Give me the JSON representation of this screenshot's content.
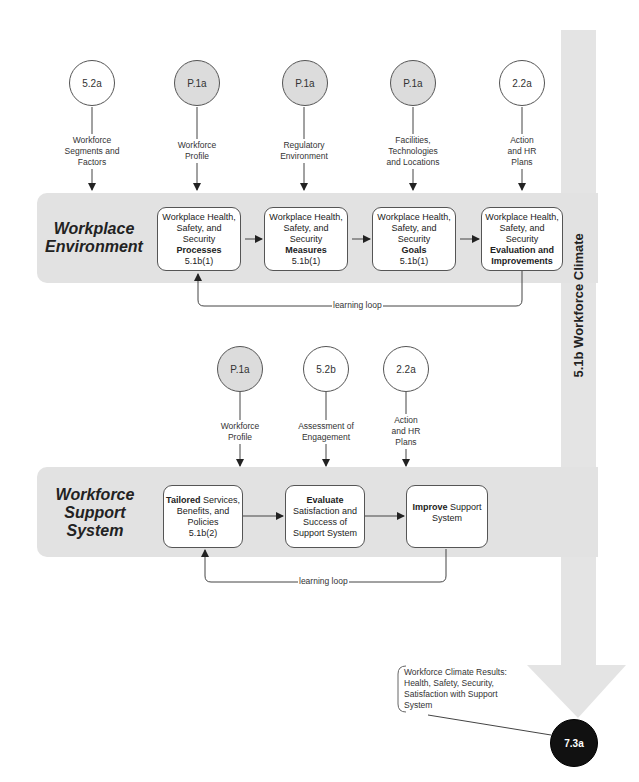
{
  "diagram": {
    "vertical_title": "5.1b  Workforce Climate",
    "workplace_environment": {
      "title_line1": "Workplace",
      "title_line2": "Environment",
      "inputs": [
        {
          "ref": "5.2a",
          "shaded": false,
          "label": [
            "Workforce",
            "Segments and",
            "Factors"
          ]
        },
        {
          "ref": "P.1a",
          "shaded": true,
          "label": [
            "Workforce",
            "Profile"
          ]
        },
        {
          "ref": "P.1a",
          "shaded": true,
          "label": [
            "Regulatory",
            "Environment"
          ]
        },
        {
          "ref": "P.1a",
          "shaded": true,
          "label": [
            "Facilities,",
            "Technologies",
            "and Locations"
          ]
        },
        {
          "ref": "2.2a",
          "shaded": false,
          "label": [
            "Action",
            "and HR",
            "Plans"
          ]
        }
      ],
      "steps": [
        {
          "lines": [
            "Workplace Health,",
            "Safety, and",
            "Security"
          ],
          "bold": [
            "Processes"
          ],
          "ref": "5.1b(1)"
        },
        {
          "lines": [
            "Workplace Health,",
            "Safety, and",
            "Security"
          ],
          "bold": [
            "Measures"
          ],
          "ref": "5.1b(1)"
        },
        {
          "lines": [
            "Workplace Health,",
            "Safety, and",
            "Security"
          ],
          "bold": [
            "Goals"
          ],
          "ref": "5.1b(1)"
        },
        {
          "lines": [
            "Workplace Health,",
            "Safety, and",
            "Security"
          ],
          "bold": [
            "Evaluation and",
            "Improvements"
          ],
          "ref": ""
        }
      ],
      "loop_label": "learning loop"
    },
    "workforce_support": {
      "title_line1": "Workforce",
      "title_line2": "Support",
      "title_line3": "System",
      "inputs": [
        {
          "ref": "P.1a",
          "shaded": true,
          "label": [
            "Workforce",
            "Profile"
          ]
        },
        {
          "ref": "5.2b",
          "shaded": false,
          "label": [
            "Assessment of",
            "Engagement"
          ]
        },
        {
          "ref": "2.2a",
          "shaded": false,
          "label": [
            "Action",
            "and HR",
            "Plans"
          ]
        }
      ],
      "steps": [
        {
          "bold_prefix": "Tailored",
          "rest_line1": " Services,",
          "lines": [
            "Benefits, and",
            "Policies",
            "5.1b(2)"
          ]
        },
        {
          "bold_prefix": "Evaluate",
          "rest_line1": "",
          "lines": [
            "Satisfaction and",
            "Success of",
            "Support System"
          ]
        },
        {
          "bold_prefix": "Improve",
          "rest_line1": " Support",
          "lines": [
            "System"
          ]
        }
      ],
      "loop_label": "learning loop"
    },
    "results": {
      "ref": "7.3a",
      "lines": [
        "Workforce Climate Results:",
        "Health, Safety, Security,",
        "Satisfaction with Support",
        "System"
      ]
    },
    "colors": {
      "band": "#e2e2e2",
      "shaded_circle": "#dcdcdc",
      "result_circle": "#111111",
      "big_arrow": "#e4e4e4"
    }
  }
}
